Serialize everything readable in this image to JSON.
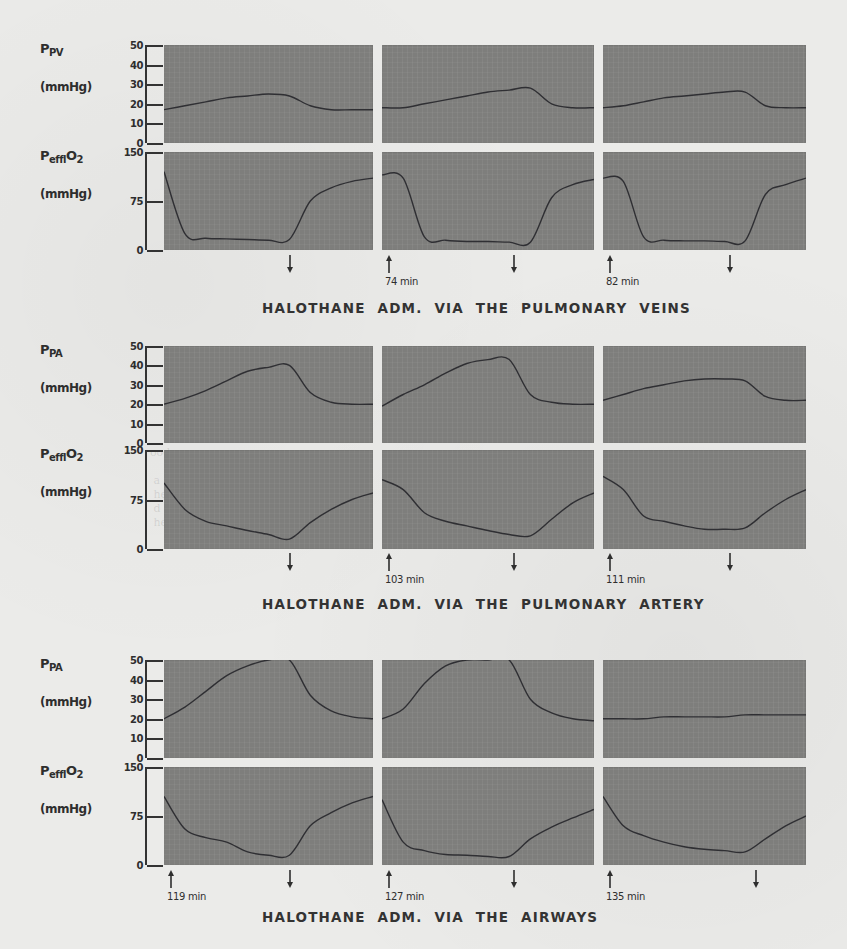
{
  "figure": {
    "sections": [
      {
        "caption": "HALOTHANE ADM. VIA THE PULMONARY VEINS",
        "top_label": {
          "symbol": "P",
          "subscript": "PV",
          "unit": "(mmHg)"
        },
        "bottom_label": {
          "symbol": "P",
          "subscript": "effl",
          "gas": "O",
          "gas_sub": "2",
          "unit": "(mmHg)"
        },
        "top_ticks": [
          "50",
          "40",
          "30",
          "20",
          "10",
          "0"
        ],
        "bottom_ticks": [
          "150",
          "75",
          "0"
        ],
        "time_markers": [
          "",
          "74 min",
          "82 min"
        ]
      },
      {
        "caption": "HALOTHANE ADM. VIA THE PULMONARY ARTERY",
        "top_label": {
          "symbol": "P",
          "subscript": "PA",
          "unit": "(mmHg)"
        },
        "bottom_label": {
          "symbol": "P",
          "subscript": "effl",
          "gas": "O",
          "gas_sub": "2",
          "unit": "(mmHg)"
        },
        "top_ticks": [
          "50",
          "40",
          "30",
          "20",
          "10",
          "0"
        ],
        "bottom_ticks": [
          "150",
          "75",
          "0"
        ],
        "time_markers": [
          "",
          "103 min",
          "111 min"
        ]
      },
      {
        "caption": "HALOTHANE ADM. VIA THE AIRWAYS",
        "top_label": {
          "symbol": "P",
          "subscript": "PA",
          "unit": "(mmHg)"
        },
        "bottom_label": {
          "symbol": "P",
          "subscript": "effl",
          "gas": "O",
          "gas_sub": "2",
          "unit": "(mmHg)"
        },
        "top_ticks": [
          "50",
          "40",
          "30",
          "20",
          "10",
          "0"
        ],
        "bottom_ticks": [
          "150",
          "75",
          "0"
        ],
        "time_markers": [
          "119 min",
          "127 min",
          "135 min"
        ]
      }
    ]
  },
  "chart_data": [
    {
      "type": "line",
      "title": "HALOTHANE ADM. VIA THE PULMONARY VEINS",
      "ylabel_top": "P_PV (mmHg)",
      "ylabel_bottom": "P_effl O2 (mmHg)",
      "ylim_top": [
        0,
        50
      ],
      "ylim_bottom": [
        0,
        150
      ],
      "x": [
        0,
        0.1,
        0.2,
        0.3,
        0.4,
        0.5,
        0.6,
        0.7,
        0.8,
        0.9,
        1.0
      ],
      "panels": [
        {
          "start_label": "",
          "pressure": [
            17,
            19,
            21,
            23,
            24,
            25,
            24,
            19,
            17,
            17,
            17
          ],
          "effl_po2": [
            120,
            25,
            18,
            17,
            16,
            15,
            16,
            75,
            95,
            105,
            110
          ]
        },
        {
          "start_label": "74 min",
          "pressure": [
            18,
            18,
            20,
            22,
            24,
            26,
            27,
            28,
            20,
            18,
            18
          ],
          "effl_po2": [
            115,
            110,
            20,
            15,
            13,
            13,
            12,
            12,
            80,
            100,
            108
          ]
        },
        {
          "start_label": "82 min",
          "pressure": [
            18,
            19,
            21,
            23,
            24,
            25,
            26,
            26,
            19,
            18,
            18
          ],
          "effl_po2": [
            110,
            105,
            20,
            15,
            14,
            14,
            13,
            14,
            85,
            100,
            110
          ]
        }
      ]
    },
    {
      "type": "line",
      "title": "HALOTHANE ADM. VIA THE PULMONARY ARTERY",
      "ylabel_top": "P_PA (mmHg)",
      "ylabel_bottom": "P_effl O2 (mmHg)",
      "ylim_top": [
        0,
        50
      ],
      "ylim_bottom": [
        0,
        150
      ],
      "x": [
        0,
        0.1,
        0.2,
        0.3,
        0.4,
        0.5,
        0.6,
        0.7,
        0.8,
        0.9,
        1.0
      ],
      "panels": [
        {
          "start_label": "",
          "pressure": [
            20,
            23,
            27,
            32,
            37,
            39,
            40,
            26,
            21,
            20,
            20
          ],
          "effl_po2": [
            100,
            60,
            42,
            35,
            28,
            22,
            15,
            40,
            60,
            75,
            85
          ]
        },
        {
          "start_label": "103 min",
          "pressure": [
            19,
            25,
            30,
            36,
            41,
            43,
            43,
            25,
            21,
            20,
            20
          ],
          "effl_po2": [
            105,
            90,
            55,
            42,
            35,
            28,
            22,
            20,
            45,
            70,
            85
          ]
        },
        {
          "start_label": "111 min",
          "pressure": [
            22,
            25,
            28,
            30,
            32,
            33,
            33,
            32,
            24,
            22,
            22
          ],
          "effl_po2": [
            110,
            90,
            50,
            42,
            35,
            30,
            30,
            32,
            55,
            75,
            90
          ]
        }
      ]
    },
    {
      "type": "line",
      "title": "HALOTHANE ADM. VIA THE AIRWAYS",
      "ylabel_top": "P_PA (mmHg)",
      "ylabel_bottom": "P_effl O2 (mmHg)",
      "ylim_top": [
        0,
        50
      ],
      "ylim_bottom": [
        0,
        150
      ],
      "x": [
        0,
        0.1,
        0.2,
        0.3,
        0.4,
        0.5,
        0.6,
        0.7,
        0.8,
        0.9,
        1.0
      ],
      "panels": [
        {
          "start_label": "119 min",
          "pressure": [
            20,
            26,
            34,
            42,
            47,
            50,
            50,
            32,
            24,
            21,
            20
          ],
          "effl_po2": [
            105,
            55,
            42,
            35,
            20,
            15,
            15,
            60,
            80,
            95,
            105
          ]
        },
        {
          "start_label": "127 min",
          "pressure": [
            20,
            25,
            38,
            47,
            50,
            50,
            50,
            30,
            23,
            20,
            19
          ],
          "effl_po2": [
            100,
            35,
            22,
            16,
            15,
            13,
            13,
            40,
            58,
            72,
            85
          ]
        },
        {
          "start_label": "135 min",
          "pressure": [
            20,
            20,
            20,
            21,
            21,
            21,
            21,
            22,
            22,
            22,
            22
          ],
          "effl_po2": [
            105,
            60,
            45,
            35,
            28,
            24,
            22,
            20,
            40,
            60,
            75
          ]
        }
      ]
    }
  ]
}
